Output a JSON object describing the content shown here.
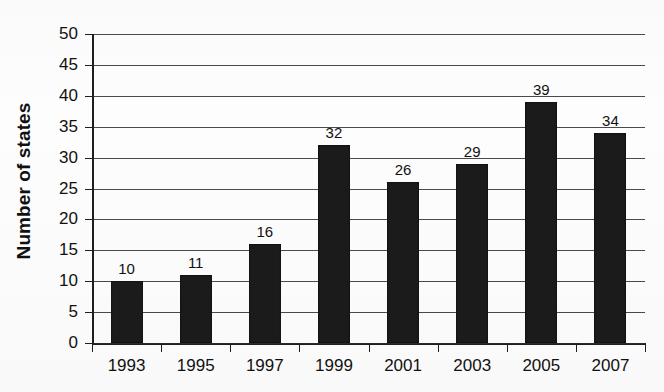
{
  "chart_data": {
    "type": "bar",
    "title": "",
    "xlabel": "",
    "ylabel": "Number of states",
    "categories": [
      "1993",
      "1995",
      "1997",
      "1999",
      "2001",
      "2003",
      "2005",
      "2007"
    ],
    "values": [
      10,
      11,
      16,
      32,
      26,
      29,
      39,
      34
    ],
    "value_labels": [
      "10",
      "11",
      "16",
      "32",
      "26",
      "29",
      "39",
      "34"
    ],
    "ylim": [
      0,
      50
    ],
    "ytick_values": [
      0,
      5,
      10,
      15,
      20,
      25,
      30,
      35,
      40,
      45,
      50
    ],
    "ytick_labels": [
      "0",
      "5",
      "10",
      "15",
      "20",
      "25",
      "30",
      "35",
      "40",
      "45",
      "50"
    ],
    "grid": true,
    "grid_axis": "y",
    "legend": false,
    "legend_position": "none",
    "bar_color": "#1b1b1b",
    "gridline_color": "#4a4a4a",
    "axis_color": "#1e1e1e",
    "background_color": "#fdfdfd",
    "text_color": "#111111",
    "data_labels_shown": true
  }
}
